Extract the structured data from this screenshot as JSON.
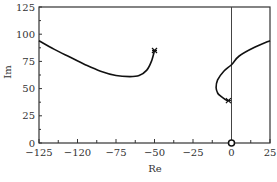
{
  "chart_data": {
    "type": "line",
    "title": "",
    "xlabel": "Re",
    "ylabel": "Im",
    "xlim": [
      -125,
      25
    ],
    "ylim": [
      0,
      125
    ],
    "grid": false,
    "legend": null,
    "x_ticks": [
      -125,
      -100,
      -75,
      -50,
      -25,
      0,
      25
    ],
    "x_tick_labels": [
      "−125",
      "−120",
      "−75",
      "−50",
      "−25",
      "0",
      "25"
    ],
    "y_ticks": [
      0,
      25,
      50,
      75,
      100,
      125
    ],
    "y_tick_labels": [
      "0",
      "25",
      "50",
      "75",
      "100",
      "125"
    ],
    "reference_lines": [
      {
        "orientation": "vertical",
        "x": 0
      }
    ],
    "markers": [
      {
        "type": "circle",
        "x": 0,
        "y": 0,
        "label": "origin"
      },
      {
        "type": "star",
        "x": -50,
        "y": 85,
        "label": "end of branch 1"
      },
      {
        "type": "star",
        "x": -2,
        "y": 39,
        "label": "end of branch 2"
      }
    ],
    "series": [
      {
        "name": "branch-1",
        "x": [
          -125,
          -115,
          -105,
          -95,
          -85,
          -75,
          -66,
          -60,
          -55,
          -52,
          -50
        ],
        "y": [
          94,
          86,
          79,
          72,
          66,
          62,
          61,
          62,
          67,
          75,
          85
        ]
      },
      {
        "name": "branch-2",
        "x": [
          25,
          15,
          5,
          0,
          -5,
          -9,
          -10,
          -9,
          -7,
          -4,
          -2
        ],
        "y": [
          94,
          88,
          80,
          72,
          66,
          58,
          51,
          46,
          43,
          40,
          39
        ]
      }
    ]
  }
}
